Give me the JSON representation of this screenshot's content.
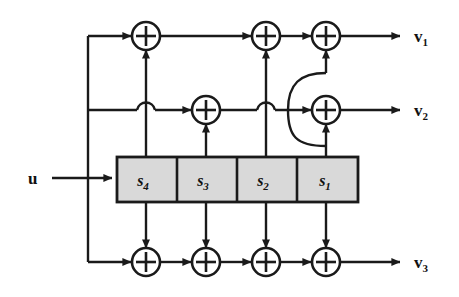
{
  "figure": {
    "type": "block-diagram",
    "colors": {
      "line": "#1a1a1a",
      "register_fill": "#d9d9d9",
      "background": "#ffffff"
    }
  },
  "input": {
    "label": "u",
    "subscript": ""
  },
  "register": {
    "name": "shift-register",
    "cells": [
      {
        "label": "s",
        "subscript": "4"
      },
      {
        "label": "s",
        "subscript": "3"
      },
      {
        "label": "s",
        "subscript": "2"
      },
      {
        "label": "s",
        "subscript": "1"
      }
    ]
  },
  "outputs": [
    {
      "label": "v",
      "subscript": "1"
    },
    {
      "label": "v",
      "subscript": "2"
    },
    {
      "label": "v",
      "subscript": "3"
    }
  ],
  "adders": {
    "top_row_count": 3,
    "middle_row_count": 2,
    "bottom_row_count": 4,
    "symbol": "+"
  }
}
